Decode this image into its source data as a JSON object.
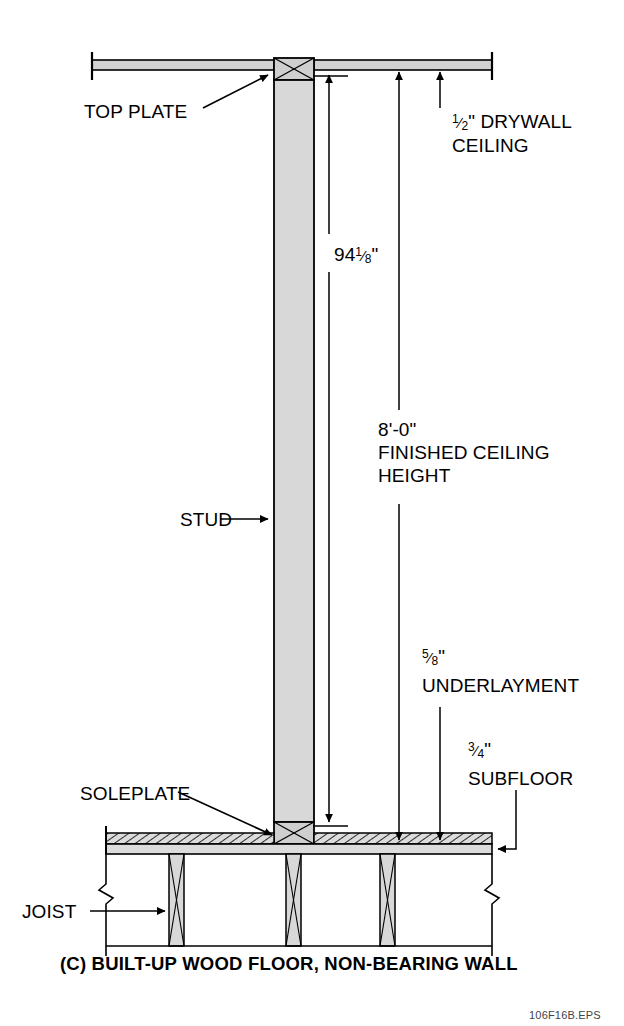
{
  "figure": {
    "caption": "(C) BUILT-UP WOOD FLOOR, NON-BEARING WALL",
    "file_code": "106F16B.EPS",
    "type": "architectural-section-detail"
  },
  "labels": {
    "top_plate": "TOP PLATE",
    "stud": "STUD",
    "soleplate": "SOLEPLATE",
    "joist": "JOIST"
  },
  "dimensions": {
    "stud_height": {
      "whole": "94",
      "num": "1",
      "den": "8",
      "unit": "\"",
      "plain": "94 1/8\""
    },
    "ceiling_height": {
      "value": "8'-0\"",
      "line1": "FINISHED CEILING",
      "line2": "HEIGHT"
    },
    "drywall": {
      "num": "1",
      "den": "2",
      "unit": "\"",
      "line1": "DRYWALL",
      "line2": "CEILING",
      "plain": "1/2\" DRYWALL CEILING"
    },
    "underlayment": {
      "num": "5",
      "den": "8",
      "unit": "\"",
      "line1": "UNDERLAYMENT",
      "plain": "5/8\" UNDERLAYMENT"
    },
    "subfloor": {
      "num": "3",
      "den": "4",
      "unit": "\"",
      "line1": "SUBFLOOR",
      "plain": "3/4\" SUBFLOOR"
    }
  },
  "colors": {
    "line": "#000000",
    "wood_fill": "#d8d8d8",
    "hatch_fill": "#c9c9c9",
    "background": "#ffffff",
    "text": "#000000",
    "file_code": "#444444"
  }
}
